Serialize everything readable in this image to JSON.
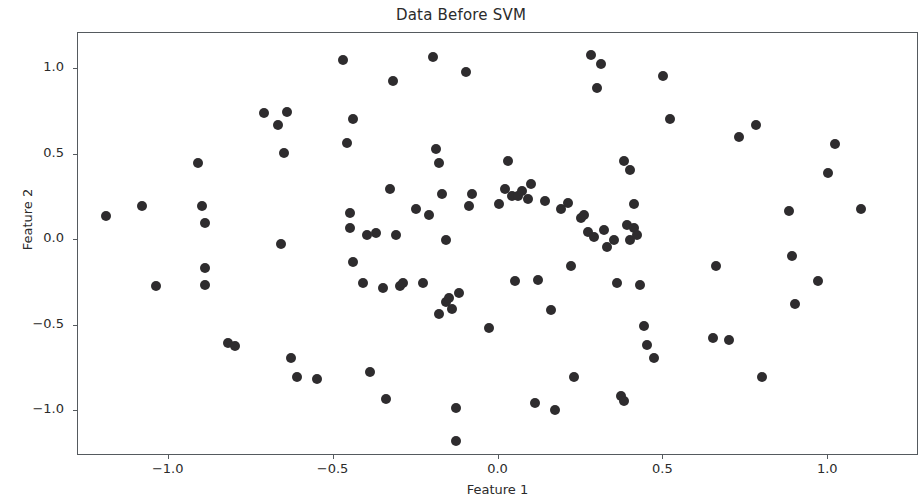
{
  "chart_data": {
    "type": "scatter",
    "title": "Data Before SVM",
    "xlabel": "Feature 1",
    "ylabel": "Feature 2",
    "xlim": [
      -1.275,
      1.275
    ],
    "ylim": [
      -1.26,
      1.21
    ],
    "xticks": [
      -1.0,
      -0.5,
      0.0,
      0.5,
      1.0
    ],
    "xticklabels": [
      "-1.0",
      "-0.5",
      "0.0",
      "0.5",
      "1.0"
    ],
    "yticks": [
      -1.0,
      -0.5,
      0.0,
      0.5,
      1.0
    ],
    "yticklabels": [
      "-1.0",
      "-0.5",
      "0.0",
      "0.5",
      "1.0"
    ],
    "grid": false,
    "legend": null,
    "marker_color": "#2e2c2e",
    "marker_size": 10,
    "series": [
      {
        "name": "samples",
        "points": [
          [
            -1.19,
            0.14
          ],
          [
            -1.08,
            0.2
          ],
          [
            -1.04,
            -0.27
          ],
          [
            -0.91,
            0.45
          ],
          [
            -0.9,
            0.2
          ],
          [
            -0.89,
            0.1
          ],
          [
            -0.89,
            -0.16
          ],
          [
            -0.89,
            -0.26
          ],
          [
            -0.82,
            -0.6
          ],
          [
            -0.8,
            -0.62
          ],
          [
            -0.71,
            0.74
          ],
          [
            -0.67,
            0.67
          ],
          [
            -0.66,
            -0.02
          ],
          [
            -0.65,
            0.51
          ],
          [
            -0.64,
            0.75
          ],
          [
            -0.63,
            -0.69
          ],
          [
            -0.61,
            -0.8
          ],
          [
            -0.55,
            -0.81
          ],
          [
            -0.47,
            1.05
          ],
          [
            -0.46,
            0.57
          ],
          [
            -0.45,
            0.16
          ],
          [
            -0.45,
            0.07
          ],
          [
            -0.44,
            -0.13
          ],
          [
            -0.44,
            0.71
          ],
          [
            -0.41,
            -0.25
          ],
          [
            -0.4,
            0.03
          ],
          [
            -0.39,
            -0.77
          ],
          [
            -0.37,
            0.04
          ],
          [
            -0.35,
            -0.28
          ],
          [
            -0.34,
            -0.93
          ],
          [
            -0.33,
            0.3
          ],
          [
            -0.32,
            0.93
          ],
          [
            -0.31,
            0.03
          ],
          [
            -0.3,
            -0.27
          ],
          [
            -0.29,
            -0.25
          ],
          [
            -0.25,
            0.18
          ],
          [
            -0.23,
            -0.25
          ],
          [
            -0.21,
            0.15
          ],
          [
            -0.2,
            1.07
          ],
          [
            -0.19,
            0.53
          ],
          [
            -0.18,
            0.45
          ],
          [
            -0.18,
            -0.43
          ],
          [
            -0.17,
            0.27
          ],
          [
            -0.16,
            0.0
          ],
          [
            -0.16,
            -0.36
          ],
          [
            -0.15,
            -0.34
          ],
          [
            -0.14,
            -0.4
          ],
          [
            -0.13,
            -0.98
          ],
          [
            -0.13,
            -1.17
          ],
          [
            -0.12,
            -0.31
          ],
          [
            -0.1,
            0.98
          ],
          [
            -0.09,
            0.2
          ],
          [
            -0.08,
            0.27
          ],
          [
            -0.03,
            -0.51
          ],
          [
            0.0,
            0.21
          ],
          [
            0.02,
            0.3
          ],
          [
            0.03,
            0.46
          ],
          [
            0.04,
            0.26
          ],
          [
            0.05,
            -0.24
          ],
          [
            0.06,
            0.26
          ],
          [
            0.07,
            0.29
          ],
          [
            0.09,
            0.24
          ],
          [
            0.1,
            0.33
          ],
          [
            0.11,
            -0.95
          ],
          [
            0.12,
            -0.23
          ],
          [
            0.14,
            0.23
          ],
          [
            0.16,
            -0.41
          ],
          [
            0.17,
            -0.99
          ],
          [
            0.19,
            0.18
          ],
          [
            0.21,
            0.22
          ],
          [
            0.22,
            -0.15
          ],
          [
            0.23,
            -0.8
          ],
          [
            0.25,
            0.13
          ],
          [
            0.26,
            0.15
          ],
          [
            0.27,
            0.05
          ],
          [
            0.28,
            1.08
          ],
          [
            0.29,
            0.02
          ],
          [
            0.3,
            0.89
          ],
          [
            0.31,
            1.03
          ],
          [
            0.32,
            0.06
          ],
          [
            0.33,
            -0.04
          ],
          [
            0.35,
            0.0
          ],
          [
            0.36,
            -0.25
          ],
          [
            0.37,
            -0.91
          ],
          [
            0.38,
            0.46
          ],
          [
            0.38,
            -0.94
          ],
          [
            0.39,
            0.09
          ],
          [
            0.4,
            0.41
          ],
          [
            0.4,
            0.0
          ],
          [
            0.41,
            0.21
          ],
          [
            0.41,
            0.07
          ],
          [
            0.42,
            0.03
          ],
          [
            0.43,
            -0.26
          ],
          [
            0.44,
            -0.5
          ],
          [
            0.45,
            -0.61
          ],
          [
            0.47,
            -0.69
          ],
          [
            0.5,
            0.96
          ],
          [
            0.52,
            0.71
          ],
          [
            0.65,
            -0.57
          ],
          [
            0.66,
            -0.15
          ],
          [
            0.7,
            -0.58
          ],
          [
            0.73,
            0.6
          ],
          [
            0.78,
            0.67
          ],
          [
            0.8,
            -0.8
          ],
          [
            0.88,
            0.17
          ],
          [
            0.89,
            -0.09
          ],
          [
            0.9,
            -0.37
          ],
          [
            0.97,
            -0.24
          ],
          [
            1.0,
            0.39
          ],
          [
            1.02,
            0.56
          ],
          [
            1.1,
            0.18
          ]
        ]
      }
    ]
  },
  "axes": {
    "title": "Data Before SVM",
    "xlabel": "Feature 1",
    "ylabel": "Feature 2"
  }
}
